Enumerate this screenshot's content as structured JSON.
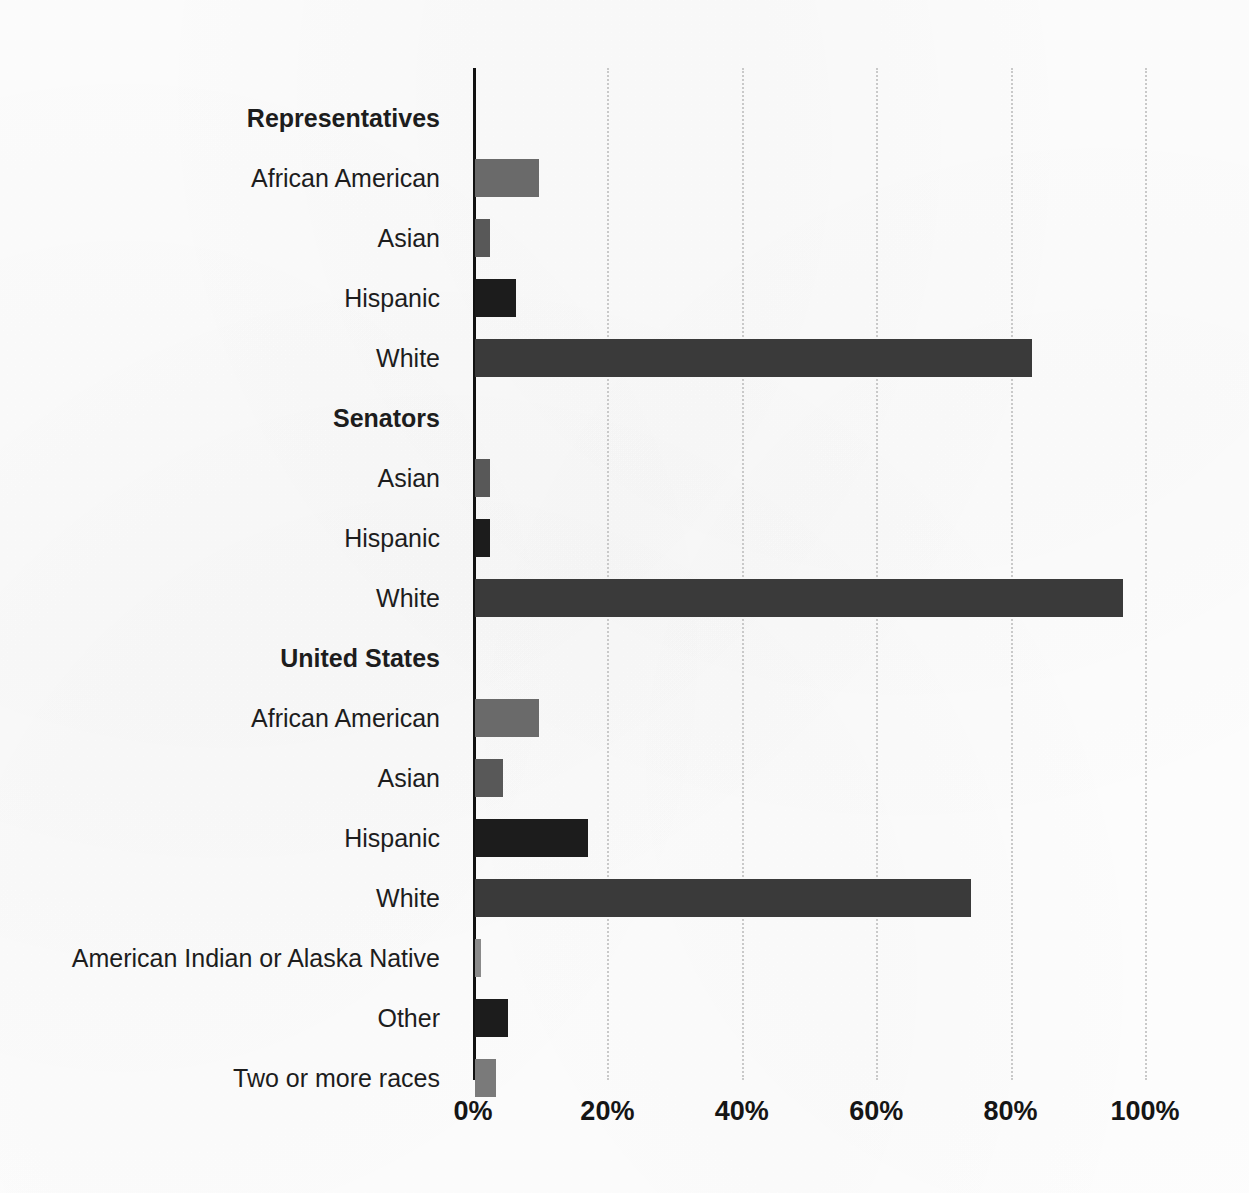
{
  "chart_data": {
    "type": "bar",
    "orientation": "horizontal",
    "title": "",
    "subtitle": "",
    "xlabel": "",
    "ylabel": "",
    "xlim": [
      0,
      100
    ],
    "xticks": [
      "0%",
      "20%",
      "40%",
      "60%",
      "80%",
      "100%"
    ],
    "xtick_values": [
      0,
      20,
      40,
      60,
      80,
      100
    ],
    "grid": "vertical-dotted",
    "legend": "none",
    "value_unit": "percent",
    "groups": [
      {
        "label": "Representatives",
        "categories": [
          "African American",
          "Asian",
          "Hispanic",
          "White"
        ],
        "values": [
          9.5,
          2.2,
          6.1,
          82.9
        ]
      },
      {
        "label": "Senators",
        "categories": [
          "Asian",
          "Hispanic",
          "White"
        ],
        "values": [
          2.2,
          2.2,
          96.4
        ]
      },
      {
        "label": "United States",
        "categories": [
          "African American",
          "Asian",
          "Hispanic",
          "White",
          "American Indian or Alaska Native",
          "Other",
          "Two or more races"
        ],
        "values": [
          9.5,
          4.2,
          16.8,
          73.8,
          0.9,
          4.9,
          3.1
        ]
      }
    ],
    "rows": [
      {
        "kind": "group",
        "label": "Representatives",
        "value": null,
        "color": ""
      },
      {
        "kind": "bar",
        "label": "African American",
        "value": 9.5,
        "color": "#6a6a6a"
      },
      {
        "kind": "bar",
        "label": "Asian",
        "value": 2.2,
        "color": "#585858"
      },
      {
        "kind": "bar",
        "label": "Hispanic",
        "value": 6.1,
        "color": "#1c1c1c"
      },
      {
        "kind": "bar",
        "label": "White",
        "value": 82.9,
        "color": "#3a3a3a"
      },
      {
        "kind": "group",
        "label": "Senators",
        "value": null,
        "color": ""
      },
      {
        "kind": "bar",
        "label": "Asian",
        "value": 2.2,
        "color": "#585858"
      },
      {
        "kind": "bar",
        "label": "Hispanic",
        "value": 2.2,
        "color": "#1c1c1c"
      },
      {
        "kind": "bar",
        "label": "White",
        "value": 96.4,
        "color": "#3a3a3a"
      },
      {
        "kind": "group",
        "label": "United States",
        "value": null,
        "color": ""
      },
      {
        "kind": "bar",
        "label": "African American",
        "value": 9.5,
        "color": "#6a6a6a"
      },
      {
        "kind": "bar",
        "label": "Asian",
        "value": 4.2,
        "color": "#585858"
      },
      {
        "kind": "bar",
        "label": "Hispanic",
        "value": 16.8,
        "color": "#1c1c1c"
      },
      {
        "kind": "bar",
        "label": "White",
        "value": 73.8,
        "color": "#3a3a3a"
      },
      {
        "kind": "bar",
        "label": "American Indian or Alaska Native",
        "value": 0.9,
        "color": "#8a8a8a"
      },
      {
        "kind": "bar",
        "label": "Other",
        "value": 4.9,
        "color": "#1c1c1c"
      },
      {
        "kind": "bar",
        "label": "Two or more races",
        "value": 3.1,
        "color": "#7a7a7a"
      }
    ]
  },
  "colors": {
    "axis": "#111111",
    "gridline": "#c9c9c9",
    "text": "#1d1d1d",
    "background": "#fefefe",
    "bar_light_gray": "#6a6a6a",
    "bar_mid_gray": "#585858",
    "bar_dark_gray": "#3a3a3a",
    "bar_black": "#1c1c1c",
    "bar_pale_gray": "#8a8a8a"
  }
}
